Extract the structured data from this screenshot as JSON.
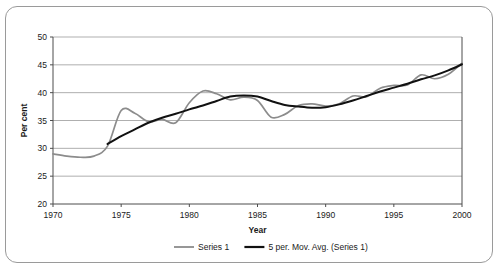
{
  "chart_data": {
    "type": "line",
    "title": "",
    "xlabel": "Year",
    "ylabel": "Per cent",
    "xlim": [
      1970,
      2000
    ],
    "ylim": [
      20,
      50
    ],
    "xticks": [
      1970,
      1975,
      1980,
      1985,
      1990,
      1995,
      2000
    ],
    "yticks": [
      20,
      25,
      30,
      35,
      40,
      45,
      50
    ],
    "grid": "horizontal",
    "legend_position": "bottom",
    "series": [
      {
        "name": "Series 1",
        "color": "#8c8c8c",
        "x": [
          1970,
          1971,
          1972,
          1973,
          1974,
          1975,
          1976,
          1977,
          1978,
          1979,
          1980,
          1981,
          1982,
          1983,
          1984,
          1985,
          1986,
          1987,
          1988,
          1989,
          1990,
          1991,
          1992,
          1993,
          1994,
          1995,
          1996,
          1997,
          1998,
          1999,
          2000
        ],
        "values": [
          29.0,
          28.6,
          28.4,
          28.6,
          30.4,
          36.8,
          36.3,
          34.8,
          35.2,
          34.6,
          38.2,
          40.3,
          39.8,
          38.7,
          39.2,
          38.6,
          35.6,
          36.1,
          37.7,
          38.0,
          37.6,
          38.0,
          39.4,
          39.3,
          40.8,
          41.3,
          41.4,
          43.2,
          42.5,
          43.3,
          45.3
        ]
      },
      {
        "name": "5 per. Mov. Avg. (Series 1)",
        "color": "#111111",
        "x": [
          1974,
          1975,
          1976,
          1977,
          1978,
          1979,
          1980,
          1981,
          1982,
          1983,
          1984,
          1985,
          1986,
          1987,
          1988,
          1989,
          1990,
          1991,
          1992,
          1993,
          1994,
          1995,
          1996,
          1997,
          1998,
          1999,
          2000
        ],
        "values": [
          30.8,
          32.2,
          33.4,
          34.6,
          35.5,
          36.2,
          37.0,
          37.7,
          38.5,
          39.3,
          39.5,
          39.3,
          38.5,
          37.8,
          37.5,
          37.3,
          37.4,
          37.9,
          38.6,
          39.4,
          40.2,
          40.9,
          41.6,
          42.4,
          43.1,
          44.0,
          45.1
        ]
      }
    ],
    "legend": [
      {
        "label": "Series 1",
        "color": "#8c8c8c"
      },
      {
        "label": "5 per. Mov. Avg. (Series 1)",
        "color": "#111111"
      }
    ]
  }
}
